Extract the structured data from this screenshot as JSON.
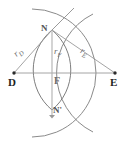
{
  "figure": {
    "background": "#ffffff",
    "stroke_color": "#8a8a8a",
    "line_color": "#9a9a9a",
    "point_color": "#2b2b2b",
    "width": 129,
    "height": 142
  },
  "points": [
    {
      "id": "D",
      "label": "D",
      "x": 14,
      "y": 73,
      "label_x": 8,
      "label_y": 76
    },
    {
      "id": "E",
      "label": "E",
      "x": 115,
      "y": 73,
      "label_x": 110,
      "label_y": 76
    },
    {
      "id": "N",
      "label": "N",
      "x": 52,
      "y": 30,
      "label_x": 41,
      "label_y": 24
    },
    {
      "id": "F",
      "label": "F",
      "x": 52,
      "y": 73,
      "label_x": 54,
      "label_y": 76
    },
    {
      "id": "Np",
      "label": "N'",
      "x": 52,
      "y": 110,
      "label_x": 53,
      "label_y": 105
    }
  ],
  "segments": [
    {
      "id": "DN",
      "from": "D",
      "to": "N",
      "label": "r",
      "sub": "D",
      "label_x": 19,
      "label_y": 52
    },
    {
      "id": "NE",
      "from": "N",
      "to": "E",
      "label": "r",
      "sub": "E",
      "label_x": 78,
      "label_y": 45
    },
    {
      "id": "NF",
      "from": "N",
      "to": "F",
      "label": "r",
      "sub": "F",
      "label_x": 54,
      "label_y": 52
    },
    {
      "id": "DE",
      "from": "D",
      "to": "E",
      "label": "",
      "sub": "",
      "label_x": 0,
      "label_y": 0
    }
  ],
  "arcs": [
    {
      "id": "arc-from-D",
      "center": "D",
      "description": "circular arc centred on D through N and N'"
    },
    {
      "id": "arc-from-E",
      "center": "E",
      "description": "circular arc centred on E through N and N'"
    }
  ],
  "axis": {
    "vertical_line": "N to N' through F with downward arrow",
    "horizontal_line": "D to E baseline"
  }
}
